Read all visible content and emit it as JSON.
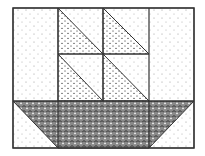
{
  "diagram": {
    "colors": {
      "stroke": "#333333",
      "background_dot": "#9a9a9a",
      "sail_pattern": "#555555",
      "hull_pattern": "#444444"
    },
    "parts": [
      {
        "name": "background",
        "fill": "light-dot"
      },
      {
        "name": "sail-top-left",
        "fill": "triangle-dot"
      },
      {
        "name": "sail-top-right",
        "fill": "triangle-dot"
      },
      {
        "name": "sail-bottom-left",
        "fill": "triangle-dot"
      },
      {
        "name": "sail-bottom-right",
        "fill": "triangle-dot"
      },
      {
        "name": "hull",
        "fill": "scallop"
      }
    ]
  }
}
